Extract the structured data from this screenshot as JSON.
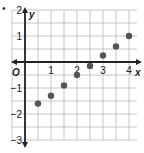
{
  "chart_data": {
    "type": "scatter",
    "title": "",
    "xlabel": "x",
    "ylabel": "y",
    "origin_label": "O",
    "xlim": [
      -0.5,
      4.3
    ],
    "ylim": [
      -3,
      2
    ],
    "grid": true,
    "grid_step": 0.5,
    "x_ticks": [
      1,
      2,
      3,
      4
    ],
    "y_ticks": [
      2,
      1,
      -1,
      -2,
      -3
    ],
    "x": [
      0.5,
      1,
      1.5,
      2,
      2.5,
      3,
      3.5,
      4
    ],
    "y": [
      -1.6,
      -1.3,
      -0.9,
      -0.5,
      -0.15,
      0.25,
      0.6,
      1.0
    ],
    "point_color": "#555555",
    "legend": null
  },
  "labels": {
    "bullet": "•",
    "x_axis": "x",
    "y_axis": "y",
    "origin": "O"
  }
}
